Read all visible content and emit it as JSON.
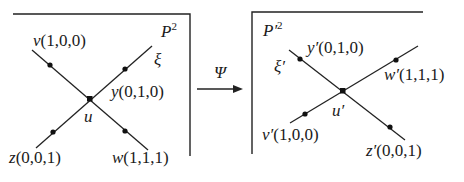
{
  "left_panel": {
    "plane_label": "P",
    "plane_sup": "2",
    "line_label": "ξ",
    "center_label": "u",
    "points": {
      "v": {
        "name": "v",
        "coords": "(1,0,0)"
      },
      "y": {
        "name": "y",
        "coords": "(0,1,0)"
      },
      "z": {
        "name": "z",
        "coords": "(0,0,1)"
      },
      "w": {
        "name": "w",
        "coords": "(1,1,1)"
      }
    }
  },
  "mapping": {
    "label": "Ψ"
  },
  "right_panel": {
    "plane_label": "P′",
    "plane_sup": "2",
    "line_label": "ξ′",
    "center_label": "u′",
    "points": {
      "y": {
        "name": "y′",
        "coords": "(0,1,0)"
      },
      "w": {
        "name": "w′",
        "coords": "(1,1,1)"
      },
      "v": {
        "name": "v′",
        "coords": "(1,0,0)"
      },
      "z": {
        "name": "z′",
        "coords": "(0,0,1)"
      }
    }
  }
}
